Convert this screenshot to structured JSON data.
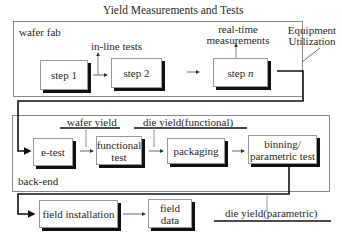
{
  "title": "Yield Measurements and Tests",
  "regions": {
    "wafer_fab": "wafer fab",
    "back_end": "back-end"
  },
  "steps": {
    "step1": "step 1",
    "step2": "step 2",
    "stepn_prefix": "step ",
    "stepn_var": "n",
    "etest": "e-test",
    "functional_test": [
      "functional",
      "test"
    ],
    "packaging": "packaging",
    "binning": [
      "binning/",
      "parametric test"
    ],
    "field_installation": "field installation",
    "field_data": [
      "field",
      "data"
    ]
  },
  "annotations": {
    "inline_tests": "in-line tests",
    "realtime": [
      "real-time",
      "measurements"
    ],
    "equipment": [
      "Equipment",
      "Utilization"
    ],
    "wafer_yield": "wafer yield",
    "die_yield_functional": "die yield(functional)",
    "die_yield_parametric": "die yield(parametric)"
  }
}
